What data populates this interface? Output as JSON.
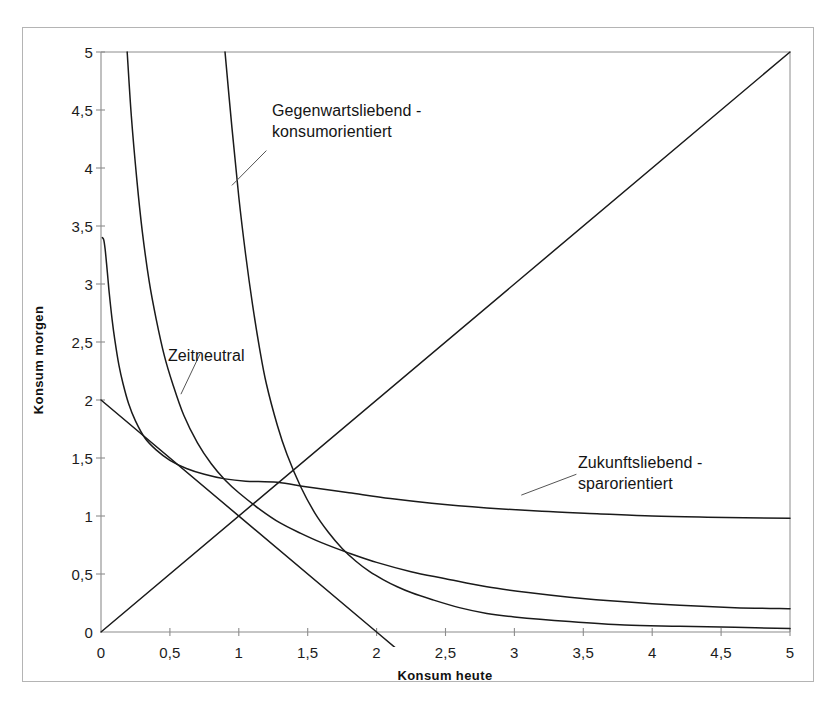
{
  "figure": {
    "background_color": "#ffffff",
    "frame_color": "#b4b4b4",
    "line_color": "#1a1a1a",
    "axis_color": "#8c8c8c"
  },
  "axes": {
    "x_title": "Konsum heute",
    "y_title": "Konsum morgen",
    "x_ticks": [
      "0",
      "0,5",
      "1",
      "1,5",
      "2",
      "2,5",
      "3",
      "3,5",
      "4",
      "4,5",
      "5"
    ],
    "y_ticks": [
      "0",
      "0,5",
      "1",
      "1,5",
      "2",
      "2,5",
      "3",
      "3,5",
      "4",
      "4,5",
      "5"
    ]
  },
  "annotations": {
    "gegenwartsliebend": {
      "line1": "Gegenwartsliebend -",
      "line2": "konsumorientiert"
    },
    "zeitneutral": {
      "line1": "Zeitneutral",
      "line2": ""
    },
    "zukunftsliebend": {
      "line1": "Zukunftsliebend -",
      "line2": "sparorientiert"
    }
  },
  "caption": {
    "text": ""
  },
  "chart_data": {
    "type": "line",
    "title": "",
    "subtitle": "",
    "xlabel": "Konsum heute",
    "ylabel": "Konsum morgen",
    "xlim": [
      0,
      5
    ],
    "ylim": [
      0,
      5
    ],
    "xticks": [
      0,
      0.5,
      1,
      1.5,
      2,
      2.5,
      3,
      3.5,
      4,
      4.5,
      5
    ],
    "yticks": [
      0,
      0.5,
      1,
      1.5,
      2,
      2.5,
      3,
      3.5,
      4,
      4.5,
      5
    ],
    "xtick_labels": [
      "0",
      "0,5",
      "1",
      "1,5",
      "2",
      "2,5",
      "3",
      "3,5",
      "4",
      "4,5",
      "5"
    ],
    "ytick_labels": [
      "0",
      "0,5",
      "1",
      "1,5",
      "2",
      "2,5",
      "3",
      "3,5",
      "4",
      "4,5",
      "5"
    ],
    "grid": false,
    "legend": "none",
    "legend_position": "inline-annotations",
    "annotations": [
      {
        "text": "Gegenwartsliebend - konsumorientiert",
        "series": "gegenwartsliebend-konsumorientiert",
        "text_xy": [
          1.25,
          4.45
        ],
        "leader_from": [
          1.2,
          4.15
        ],
        "leader_to": [
          0.95,
          3.85
        ]
      },
      {
        "text": "Zeitneutral",
        "series": "zeitneutral",
        "text_xy": [
          0.55,
          2.55
        ],
        "leader_from": [
          0.72,
          2.4
        ],
        "leader_to": [
          0.58,
          2.05
        ]
      },
      {
        "text": "Zukunftsliebend - sparorientiert",
        "series": "zukunftsliebend-sparorientiert",
        "text_xy": [
          3.5,
          1.5
        ],
        "leader_from": [
          3.45,
          1.36
        ],
        "leader_to": [
          3.05,
          1.18
        ]
      }
    ],
    "series": [
      {
        "name": "gegenwartsliebend-konsumorientiert",
        "kind": "indifference-curve",
        "note": "steep indifference curve, high preference for present consumption",
        "x": [
          0.9,
          0.95,
          1.0,
          1.05,
          1.1,
          1.15,
          1.2,
          1.28,
          1.35,
          1.45,
          1.55,
          1.65,
          1.75,
          1.85,
          1.95,
          2.05,
          2.15,
          2.25,
          2.4,
          2.6,
          2.8,
          3.0,
          3.4,
          3.8,
          4.2,
          4.6,
          5.0
        ],
        "y": [
          5.0,
          4.35,
          3.75,
          3.25,
          2.82,
          2.45,
          2.14,
          1.78,
          1.53,
          1.25,
          1.03,
          0.86,
          0.72,
          0.61,
          0.52,
          0.45,
          0.39,
          0.34,
          0.28,
          0.21,
          0.16,
          0.13,
          0.09,
          0.06,
          0.05,
          0.04,
          0.03
        ]
      },
      {
        "name": "zeitneutral",
        "kind": "indifference-curve",
        "note": "symmetric indifference curve, neutral time preference",
        "x": [
          0.19,
          0.22,
          0.26,
          0.3,
          0.35,
          0.4,
          0.46,
          0.52,
          0.6,
          0.7,
          0.8,
          0.9,
          1.0,
          1.15,
          1.3,
          1.45,
          1.6,
          1.8,
          2.0,
          2.25,
          2.5,
          2.8,
          3.1,
          3.4,
          3.8,
          4.2,
          4.6,
          5.0
        ],
        "y": [
          5.0,
          4.45,
          3.9,
          3.45,
          3.02,
          2.7,
          2.38,
          2.14,
          1.87,
          1.63,
          1.45,
          1.31,
          1.2,
          1.06,
          0.94,
          0.85,
          0.77,
          0.68,
          0.6,
          0.52,
          0.46,
          0.39,
          0.34,
          0.3,
          0.26,
          0.23,
          0.21,
          0.2
        ]
      },
      {
        "name": "zukunftsliebend-sparorientiert",
        "kind": "indifference-curve",
        "note": "flat indifference curve, high preference for future consumption",
        "x": [
          0.01,
          0.02,
          0.03,
          0.04,
          0.05,
          0.06,
          0.08,
          0.1,
          0.13,
          0.16,
          0.2,
          0.25,
          0.32,
          0.4,
          0.5,
          0.62,
          0.75,
          0.9,
          1.05,
          1.28,
          1.5,
          1.8,
          2.1,
          2.4,
          2.8,
          3.2,
          3.6,
          4.0,
          4.4,
          5.0
        ],
        "y": [
          3.4,
          3.38,
          3.3,
          3.18,
          3.05,
          2.92,
          2.7,
          2.52,
          2.3,
          2.14,
          1.97,
          1.82,
          1.67,
          1.57,
          1.48,
          1.41,
          1.36,
          1.32,
          1.3,
          1.29,
          1.25,
          1.2,
          1.15,
          1.11,
          1.07,
          1.04,
          1.02,
          1.0,
          0.99,
          0.98
        ]
      },
      {
        "name": "45-degree-ray",
        "kind": "straight-line",
        "note": "45 degree line where consumption today equals consumption tomorrow",
        "x": [
          0,
          5
        ],
        "y": [
          0,
          5
        ]
      },
      {
        "name": "budget-line",
        "kind": "straight-line",
        "note": "intertemporal budget constraint, intercepts at (0,2) and (2,0)",
        "x": [
          0,
          2,
          2.12
        ],
        "y": [
          2,
          0,
          -0.12
        ]
      }
    ],
    "key_points": [
      {
        "label": "three-curve tangency",
        "x": 1.28,
        "y": 1.29
      },
      {
        "label": "budget y-intercept",
        "x": 0,
        "y": 2
      },
      {
        "label": "budget x-intercept",
        "x": 2,
        "y": 0
      },
      {
        "label": "ray endpoint",
        "x": 5,
        "y": 5
      }
    ]
  }
}
